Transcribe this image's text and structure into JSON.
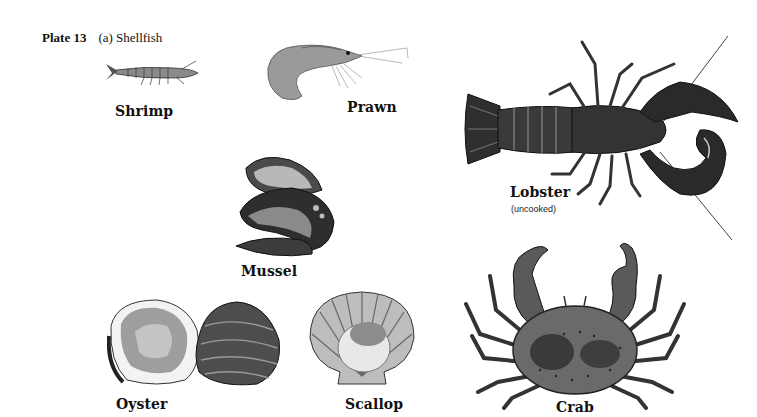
{
  "plate": {
    "number_label": "Plate 13",
    "subtitle": "(a) Shellfish"
  },
  "items": [
    {
      "name": "Shrimp",
      "icon": "shrimp-illustration"
    },
    {
      "name": "Prawn",
      "icon": "prawn-illustration"
    },
    {
      "name": "Lobster",
      "note": "(uncooked)",
      "icon": "lobster-illustration"
    },
    {
      "name": "Mussel",
      "icon": "mussel-illustration"
    },
    {
      "name": "Oyster",
      "icon": "oyster-illustration"
    },
    {
      "name": "Scallop",
      "icon": "scallop-illustration"
    },
    {
      "name": "Crab",
      "icon": "crab-illustration"
    }
  ],
  "colors": {
    "background": "#ffffff",
    "ink": "#111111",
    "shell_dark": "#2a2a2a",
    "shell_mid": "#6e6e6e",
    "shell_light": "#c8c8c8"
  }
}
